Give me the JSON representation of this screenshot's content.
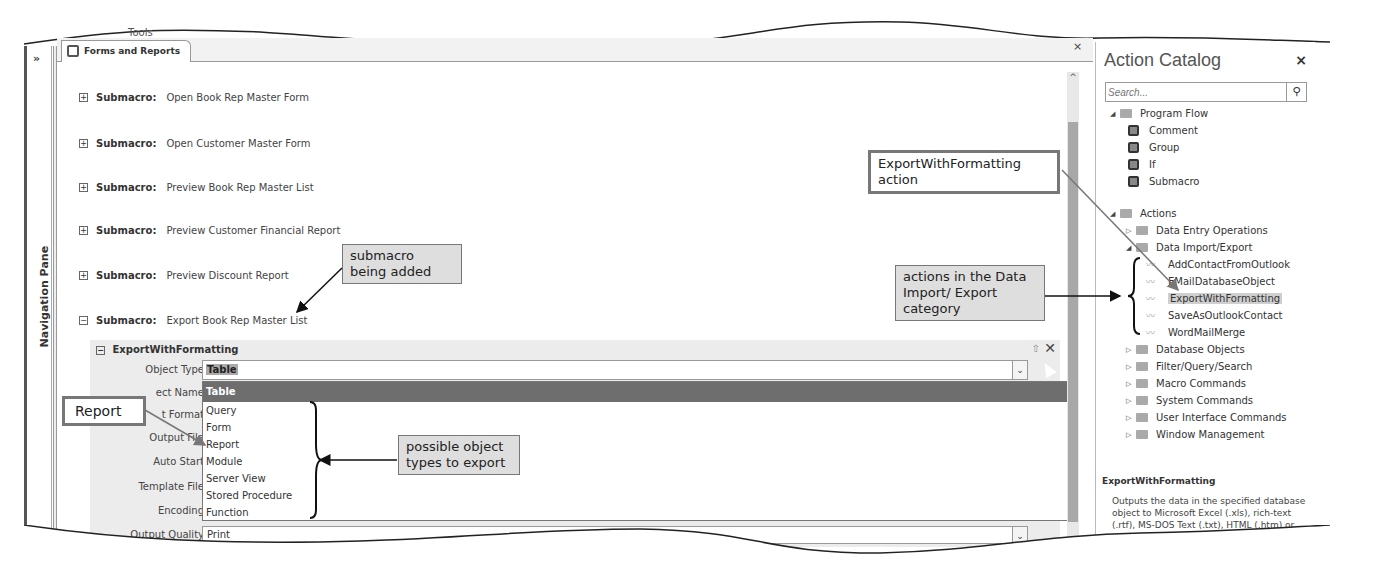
{
  "ribbon": {
    "partial_label": "Tools"
  },
  "nav_pane": {
    "expand_glyph": "»",
    "label": "Navigation Pane"
  },
  "document": {
    "tab_label": "Forms and Reports",
    "close_glyph": "×"
  },
  "submacros": [
    {
      "expander": "+",
      "keyword": "Submacro:",
      "name": "Open Book Rep Master Form"
    },
    {
      "expander": "+",
      "keyword": "Submacro:",
      "name": "Open Customer Master Form"
    },
    {
      "expander": "+",
      "keyword": "Submacro:",
      "name": "Preview Book Rep Master List"
    },
    {
      "expander": "+",
      "keyword": "Submacro:",
      "name": "Preview Customer Financial Report"
    },
    {
      "expander": "+",
      "keyword": "Submacro:",
      "name": "Preview Discount Report"
    },
    {
      "expander": "−",
      "keyword": "Submacro:",
      "name": "Export Book Rep Master List"
    }
  ],
  "action": {
    "expander": "−",
    "name": "ExportWithFormatting",
    "move_up_glyph": "⇧",
    "delete_glyph": "✕",
    "arguments": [
      {
        "label": "Object Type"
      },
      {
        "label": "ect Name"
      },
      {
        "label": "t Format"
      },
      {
        "label": "Output File"
      },
      {
        "label": "Auto Start"
      },
      {
        "label": "Template File"
      },
      {
        "label": "Encoding"
      },
      {
        "label": "Output Quality"
      }
    ],
    "object_type_value": "Table",
    "combo_glyph": "⌄",
    "dropdown_options": [
      "Table",
      "Query",
      "Form",
      "Report",
      "Module",
      "Server View",
      "Stored Procedure",
      "Function"
    ],
    "dropdown_selected": "Table",
    "output_quality_value": "Print"
  },
  "scrollbar": {
    "up_glyph": "^"
  },
  "action_catalog": {
    "title": "Action Catalog",
    "close_glyph": "×",
    "search_placeholder": "Search...",
    "search_glyph": "⚲",
    "program_flow": {
      "label": "Program Flow",
      "items": [
        "Comment",
        "Group",
        "If",
        "Submacro"
      ]
    },
    "actions": {
      "label": "Actions",
      "categories": [
        {
          "label": "Data Entry Operations",
          "state": "collapsed"
        },
        {
          "label": "Data Import/Export",
          "state": "expanded",
          "items": [
            "AddContactFromOutlook",
            "EMailDatabaseObject",
            "ExportWithFormatting",
            "SaveAsOutlookContact",
            "WordMailMerge"
          ],
          "selected": "ExportWithFormatting"
        },
        {
          "label": "Database Objects",
          "state": "collapsed"
        },
        {
          "label": "Filter/Query/Search",
          "state": "collapsed"
        },
        {
          "label": "Macro Commands",
          "state": "collapsed"
        },
        {
          "label": "System Commands",
          "state": "collapsed"
        },
        {
          "label": "User Interface Commands",
          "state": "collapsed"
        },
        {
          "label": "Window Management",
          "state": "collapsed"
        }
      ]
    },
    "description": {
      "title": "ExportWithFormatting",
      "text": "Outputs the data in the specified database object to Microsoft Excel (.xls), rich-text (.rtf), MS-DOS Text (.txt), HTML (.htm) or"
    }
  },
  "callouts": {
    "submacro_added": "submacro being added",
    "export_action": "ExportWithFormatting action",
    "import_export_actions": "actions in the Data Import/ Export category",
    "report": "Report",
    "object_types": "possible object types to export"
  }
}
